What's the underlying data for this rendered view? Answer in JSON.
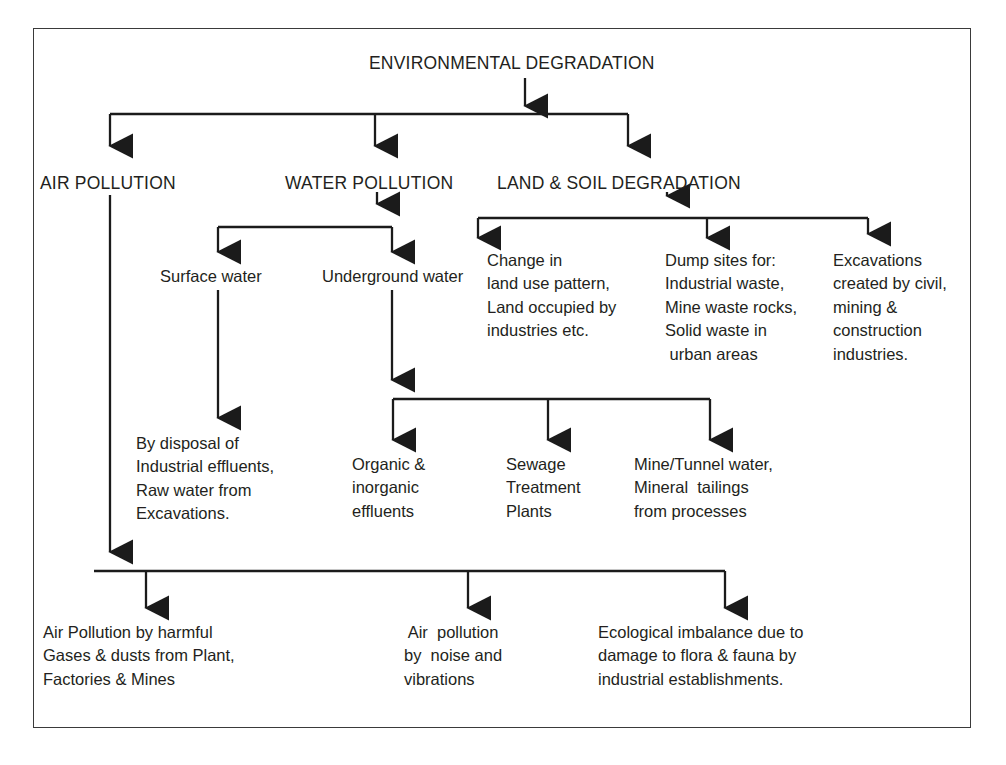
{
  "diagram": {
    "title": "ENVIRONMENTAL DEGRADATION",
    "type": "flowchart",
    "orientation": "top-down",
    "border_color": "#3a3a3a",
    "text_color": "#231f20",
    "level1": {
      "label": "ENVIRONMENTAL DEGRADATION"
    },
    "level2": [
      {
        "label": "AIR POLLUTION"
      },
      {
        "label": "WATER POLLUTION"
      },
      {
        "label": "LAND & SOIL DEGRADATION"
      }
    ],
    "water_children": [
      {
        "label": "Surface water"
      },
      {
        "label": "Underground water"
      }
    ],
    "land_children": [
      {
        "label": "Change in\nland use pattern,\nLand occupied by\nindustries etc."
      },
      {
        "label": "Dump sites for:\nIndustrial waste,\nMine waste rocks,\nSolid waste in\n urban areas"
      },
      {
        "label": "Excavations\ncreated by civil,\nmining &\nconstruction\nindustries."
      }
    ],
    "surface_water_child": {
      "label": "By disposal of\nIndustrial effluents,\nRaw water from\nExcavations."
    },
    "underground_children": [
      {
        "label": "Organic &\ninorganic\neffluents"
      },
      {
        "label": "Sewage\nTreatment\nPlants"
      },
      {
        "label": "Mine/Tunnel water,\nMineral  tailings\nfrom processes"
      }
    ],
    "outcomes": [
      {
        "label": "Air Pollution by harmful\nGases & dusts from Plant,\nFactories & Mines"
      },
      {
        "label": " Air  pollution\nby  noise and\nvibrations"
      },
      {
        "label": "Ecological imbalance due to\ndamage to flora & fauna by\nindustrial establishments."
      }
    ]
  }
}
